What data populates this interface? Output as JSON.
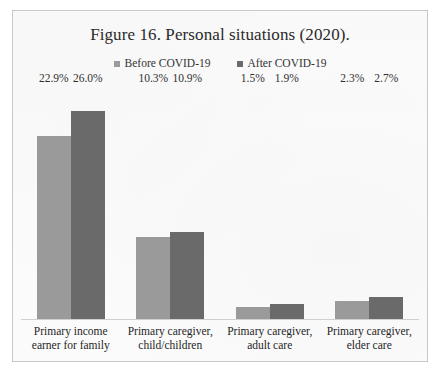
{
  "figure": {
    "title": "Figure 16. Personal situations (2020)."
  },
  "legend": [
    {
      "label": "Before COVID-19",
      "color": "#9a9a9a",
      "key": "before"
    },
    {
      "label": "After COVID-19",
      "color": "#6a6a6a",
      "key": "after"
    }
  ],
  "chart_data": {
    "type": "bar",
    "title": "Figure 16. Personal situations (2020).",
    "xlabel": "",
    "ylabel": "",
    "ylim": [
      0,
      29
    ],
    "grid": false,
    "legend_position": "top-center",
    "value_label_suffix": "%",
    "categories": [
      "Primary income earner for family",
      "Primary caregiver, child/children",
      "Primary caregiver, adult care",
      "Primary caregiver, elder care"
    ],
    "category_lines": [
      [
        "Primary income",
        "earner for family"
      ],
      [
        "Primary caregiver,",
        "child/children"
      ],
      [
        "Primary caregiver,",
        "adult care"
      ],
      [
        "Primary caregiver,",
        "elder care"
      ]
    ],
    "series": [
      {
        "name": "Before COVID-19",
        "color": "#9a9a9a",
        "values": [
          22.9,
          10.3,
          1.5,
          2.3
        ],
        "labels": [
          "22.9%",
          "10.3%",
          "1.5%",
          "2.3%"
        ]
      },
      {
        "name": "After COVID-19",
        "color": "#6a6a6a",
        "values": [
          26.0,
          10.9,
          1.9,
          2.7
        ],
        "labels": [
          "26.0%",
          "10.9%",
          "1.9%",
          "2.7%"
        ]
      }
    ]
  }
}
